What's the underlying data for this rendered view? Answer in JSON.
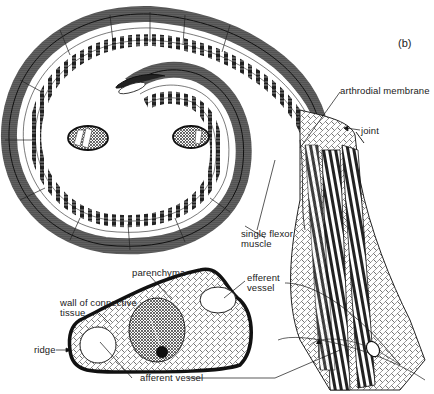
{
  "figure": {
    "panel_label": "(b)",
    "labels": {
      "arthrodial_membrane": "arthrodial membrane",
      "joint": "joint",
      "single_flexor_muscle_line1": "single flexor",
      "single_flexor_muscle_line2": "muscle",
      "parenchyma": "parenchyma",
      "efferent_vessel_line1": "efferent",
      "efferent_vessel_line2": "vessel",
      "wall_line1": "wall of connective",
      "wall_line2": "tissue",
      "ridge": "ridge",
      "afferent_vessel": "afferent vessel"
    },
    "colors": {
      "ink": "#1a1a1a",
      "background": "#ffffff",
      "stipple": "#333333"
    }
  }
}
